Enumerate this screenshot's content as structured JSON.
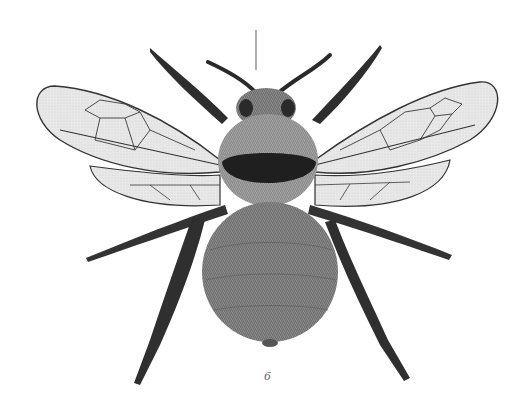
{
  "illustration": {
    "subject": "bumblebee",
    "view": "dorsal",
    "style": "engraved scientific plate",
    "figure_number": "6",
    "colors": {
      "background": "#ffffff",
      "ink_dark": "#1e1e1e",
      "fur_mid": "#7a7a7a",
      "fur_light": "#a8a8a8",
      "wing_fill": "#e4e4e4",
      "vein": "#3a3a3a"
    }
  }
}
